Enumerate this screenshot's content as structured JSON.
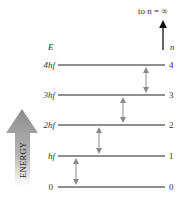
{
  "diagram": {
    "axis_label_left": "E",
    "axis_label_right": "n",
    "top_note": "to n = ∞",
    "energy_label": "ENERGY",
    "levels": [
      {
        "n": "0",
        "energy": "0",
        "y": 187
      },
      {
        "n": "1",
        "energy": "hf",
        "y": 156
      },
      {
        "n": "2",
        "energy": "2hf",
        "y": 125
      },
      {
        "n": "3",
        "energy": "3hf",
        "y": 95
      },
      {
        "n": "4",
        "energy": "4hf",
        "y": 65
      }
    ],
    "transitions": [
      {
        "from": "0",
        "to": "1",
        "x": 76
      },
      {
        "from": "1",
        "to": "2",
        "x": 99
      },
      {
        "from": "2",
        "to": "3",
        "x": 123
      },
      {
        "from": "3",
        "to": "4",
        "x": 146
      }
    ],
    "colors": {
      "level_line": "#222222",
      "transition_arrow": "#8a8a8a",
      "energy_arrow": "#8c8c8c"
    }
  }
}
